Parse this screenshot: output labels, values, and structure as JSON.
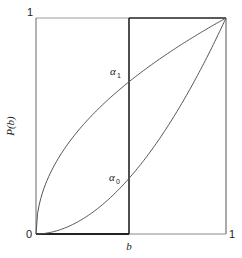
{
  "chart_data": {
    "type": "line",
    "title": "",
    "xlabel": "",
    "ylabel": "P(b)",
    "xlim": [
      0,
      1
    ],
    "ylim": [
      0,
      1
    ],
    "grid": false,
    "legend": null,
    "x_ticks": [
      {
        "value": 0,
        "label": ""
      },
      {
        "value": 0.49,
        "label": "b"
      },
      {
        "value": 1,
        "label": "1"
      }
    ],
    "y_ticks": [
      {
        "value": 0,
        "label": "0"
      },
      {
        "value": 1,
        "label": "1"
      }
    ],
    "series": [
      {
        "name": "upper curve (concave)",
        "x": [
          0,
          0.1,
          0.2,
          0.3,
          0.4,
          0.49,
          0.6,
          0.7,
          0.8,
          0.9,
          1.0
        ],
        "y": [
          0,
          0.32,
          0.455,
          0.555,
          0.64,
          0.705,
          0.78,
          0.84,
          0.897,
          0.95,
          1.0
        ]
      },
      {
        "name": "lower curve (convex)",
        "x": [
          0,
          0.1,
          0.2,
          0.3,
          0.4,
          0.49,
          0.6,
          0.7,
          0.8,
          0.9,
          1.0
        ],
        "y": [
          0,
          0.013,
          0.047,
          0.101,
          0.175,
          0.258,
          0.379,
          0.508,
          0.654,
          0.818,
          1.0
        ]
      }
    ],
    "vertical_line": {
      "x": 0.49,
      "label": "b"
    },
    "annotations": [
      {
        "text": "α",
        "subscript": "1",
        "x": 0.49,
        "y": 0.705
      },
      {
        "text": "α",
        "subscript": "0",
        "x": 0.49,
        "y": 0.258
      }
    ]
  },
  "labels": {
    "y_axis": "P(b)",
    "y_top": "1",
    "y_bottom": "0",
    "x_b": "b",
    "x_right": "1",
    "alpha": "α",
    "alpha1_sub": "1",
    "alpha0_sub": "0"
  }
}
